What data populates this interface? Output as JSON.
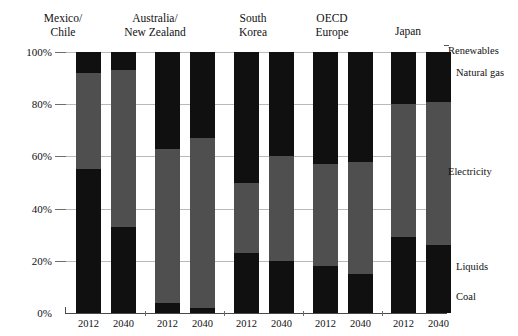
{
  "chart_data": {
    "type": "bar",
    "stacked": true,
    "normalized": true,
    "title": "",
    "subtitle": "",
    "xlabel": "",
    "ylabel": "",
    "ylim": [
      0,
      100
    ],
    "ytick_labels": [
      "0%",
      "20%",
      "40%",
      "60%",
      "80%",
      "100%"
    ],
    "ytick_values": [
      0,
      20,
      40,
      60,
      80,
      100
    ],
    "grid": true,
    "legend_position": "right",
    "groups": [
      "Mexico/ Chile",
      "Australia/ New Zealand",
      "South Korea",
      "OECD Europe",
      "Japan"
    ],
    "categories": [
      "2012",
      "2040",
      "2012",
      "2040",
      "2012",
      "2040",
      "2012",
      "2040",
      "2012",
      "2040"
    ],
    "series": [
      {
        "name": "Coal",
        "color": "#101010",
        "values": [
          55,
          33,
          4,
          2,
          23,
          20,
          18,
          15,
          29,
          26
        ]
      },
      {
        "name": "Liquids + Electricity + Natural gas",
        "color": "#4f4f4f",
        "values": [
          37,
          60,
          59,
          65,
          27,
          40,
          39,
          43,
          51,
          55
        ]
      },
      {
        "name": "Renewables",
        "color": "#101010",
        "values": [
          8,
          7,
          37,
          33,
          50,
          40,
          43,
          42,
          20,
          19
        ]
      }
    ],
    "series_labels": [
      "Renewables",
      "Natural gas",
      "Electricity",
      "Liquids",
      "Coal"
    ]
  },
  "groups": [
    {
      "id": "mexico-chile",
      "line1": "Mexico/",
      "line2": "Chile"
    },
    {
      "id": "australia-nz",
      "line1": "Australia/",
      "line2": "New Zealand"
    },
    {
      "id": "south-korea",
      "line1": "South",
      "line2": "Korea"
    },
    {
      "id": "oecd-europe",
      "line1": "OECD",
      "line2": "Europe"
    },
    {
      "id": "japan",
      "line1": "Japan",
      "line2": ""
    }
  ],
  "y_axis": {
    "labels": [
      "100%",
      "80%",
      "60%",
      "40%",
      "20%",
      "0%"
    ],
    "values": [
      100,
      80,
      60,
      40,
      20,
      0
    ]
  },
  "x_axis": {
    "labels": [
      "2012",
      "2040",
      "2012",
      "2040",
      "2012",
      "2040",
      "2012",
      "2040",
      "2012",
      "2040"
    ]
  },
  "series_labels": [
    {
      "id": "renewables",
      "text": "Renewables",
      "y": 45,
      "leader": true,
      "indent": false
    },
    {
      "id": "natural-gas",
      "text": "Natural gas",
      "y": 67,
      "leader": false,
      "indent": true
    },
    {
      "id": "electricity",
      "text": "Electricity",
      "y": 166,
      "leader": false,
      "indent": false
    },
    {
      "id": "liquids",
      "text": "Liquids",
      "y": 261,
      "leader": false,
      "indent": true
    },
    {
      "id": "coal",
      "text": "Coal",
      "y": 291,
      "leader": false,
      "indent": true
    }
  ],
  "bars": [
    {
      "id": "mexico-chile-2012",
      "x": 10,
      "coal": 55,
      "mid": 37,
      "top": 8
    },
    {
      "id": "mexico-chile-2040",
      "x": 45,
      "coal": 33,
      "mid": 60,
      "top": 7
    },
    {
      "id": "australia-nz-2012",
      "x": 89,
      "coal": 4,
      "mid": 59,
      "top": 37
    },
    {
      "id": "australia-nz-2040",
      "x": 124,
      "coal": 2,
      "mid": 65,
      "top": 33
    },
    {
      "id": "south-korea-2012",
      "x": 168,
      "coal": 23,
      "mid": 27,
      "top": 50
    },
    {
      "id": "south-korea-2040",
      "x": 203,
      "coal": 20,
      "mid": 40,
      "top": 40
    },
    {
      "id": "oecd-europe-2012",
      "x": 247,
      "coal": 18,
      "mid": 39,
      "top": 43
    },
    {
      "id": "oecd-europe-2040",
      "x": 282,
      "coal": 15,
      "mid": 43,
      "top": 42
    },
    {
      "id": "japan-2012",
      "x": 325,
      "coal": 29,
      "mid": 51,
      "top": 20
    },
    {
      "id": "japan-2040",
      "x": 360,
      "coal": 26,
      "mid": 55,
      "top": 19
    }
  ],
  "colors": {
    "dark": "#101010",
    "mid": "#4f4f4f",
    "grid": "#b9b9b9",
    "axis": "#4a4a4a",
    "background": "#ffffff"
  }
}
